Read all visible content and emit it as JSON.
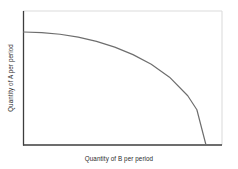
{
  "figure": {
    "background_color": "#ffffff"
  },
  "chart_data": {
    "type": "line",
    "title": "",
    "subtitle": "",
    "xlabel": "Quantity of B per period",
    "ylabel": "Quantity of A per period",
    "xlim": [
      0,
      1
    ],
    "ylim": [
      0,
      1
    ],
    "grid": false,
    "legend": null,
    "xticks": [],
    "yticks": [],
    "xticklabels": [],
    "yticklabels": [],
    "annotations": [],
    "series": [
      {
        "name": "Production possibilities frontier",
        "color": "#6e6e6e",
        "linewidth": 1.2,
        "shape": "concave-to-origin",
        "x": [
          0.0,
          0.1,
          0.2,
          0.3,
          0.4,
          0.5,
          0.6,
          0.7,
          0.8,
          0.9,
          0.95,
          1.0
        ],
        "y": [
          1.0,
          0.995,
          0.98,
          0.954,
          0.917,
          0.866,
          0.8,
          0.714,
          0.6,
          0.436,
          0.312,
          0.0
        ]
      }
    ],
    "axes_style": {
      "left_spine_color": "#3d3d3d",
      "bottom_spine_color": "#3d3d3d",
      "top_spine_color": "#dcdcdc",
      "right_spine_color": "#dcdcdc",
      "label_color": "#2b2b2b"
    }
  }
}
